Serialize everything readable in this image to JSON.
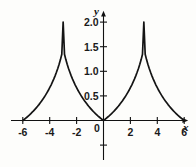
{
  "figure": {
    "background_color": "#fdfdfb",
    "ink_color": "#111111",
    "curve_color": "#141414"
  },
  "axes": {
    "x_axis_name": "x",
    "y_axis_name": "y",
    "origin_label": "0"
  },
  "chart_data": {
    "type": "line",
    "title": "",
    "xlabel": "x",
    "ylabel": "y",
    "xlim": [
      -6.6,
      6.6
    ],
    "ylim": [
      -0.85,
      2.25
    ],
    "grid": false,
    "legend": null,
    "x_ticks": [
      -6,
      -4,
      -2,
      0,
      2,
      4,
      6
    ],
    "x_tick_labels": [
      "-6",
      "-4",
      "-2",
      "0",
      "2",
      "4",
      "6"
    ],
    "y_ticks": [
      0.5,
      1.0,
      1.5,
      2.0
    ],
    "y_tick_labels": [
      "0.5",
      "1.0",
      "1.5",
      "2.0"
    ],
    "annotations": [
      {
        "text": "peak",
        "x": -3,
        "y": 2.0
      },
      {
        "text": "peak",
        "x": 3,
        "y": 2.0
      },
      {
        "text": "zero",
        "x": 0,
        "y": 0
      },
      {
        "text": "zero",
        "x": -6,
        "y": 0
      },
      {
        "text": "zero",
        "x": 6,
        "y": 0
      }
    ],
    "series": [
      {
        "name": "curve",
        "x": [
          -6.0,
          -5.9,
          -5.8,
          -5.7,
          -5.6,
          -5.5,
          -5.4,
          -5.3,
          -5.2,
          -5.1,
          -5.0,
          -4.9,
          -4.8,
          -4.7,
          -4.6,
          -4.5,
          -4.4,
          -4.3,
          -4.2,
          -4.1,
          -4.0,
          -3.9,
          -3.8,
          -3.7,
          -3.6,
          -3.5,
          -3.4,
          -3.3,
          -3.2,
          -3.1,
          -3.0,
          -2.9,
          -2.8,
          -2.7,
          -2.6,
          -2.5,
          -2.4,
          -2.3,
          -2.2,
          -2.1,
          -2.0,
          -1.9,
          -1.8,
          -1.7,
          -1.6,
          -1.5,
          -1.4,
          -1.3,
          -1.2,
          -1.1,
          -1.0,
          -0.9,
          -0.8,
          -0.7,
          -0.6,
          -0.5,
          -0.4,
          -0.3,
          -0.2,
          -0.1,
          0.0,
          0.1,
          0.2,
          0.3,
          0.4,
          0.5,
          0.6,
          0.7,
          0.8,
          0.9,
          1.0,
          1.1,
          1.2,
          1.3,
          1.4,
          1.5,
          1.6,
          1.7,
          1.8,
          1.9,
          2.0,
          2.1,
          2.2,
          2.3,
          2.4,
          2.5,
          2.6,
          2.7,
          2.8,
          2.9,
          3.0,
          3.1,
          3.2,
          3.3,
          3.4,
          3.5,
          3.6,
          3.7,
          3.8,
          3.9,
          4.0,
          4.1,
          4.2,
          4.3,
          4.4,
          4.5,
          4.6,
          4.7,
          4.8,
          4.9,
          5.0,
          5.1,
          5.2,
          5.3,
          5.4,
          5.5,
          5.6,
          5.7,
          5.8,
          5.9,
          6.0
        ],
        "y": [
          0.0,
          0.021,
          0.043,
          0.066,
          0.09,
          0.115,
          0.141,
          0.168,
          0.196,
          0.226,
          0.257,
          0.289,
          0.323,
          0.359,
          0.396,
          0.435,
          0.476,
          0.52,
          0.566,
          0.614,
          0.666,
          0.72,
          0.779,
          0.841,
          0.908,
          0.98,
          1.058,
          1.143,
          1.238,
          1.348,
          2.0,
          1.348,
          1.238,
          1.143,
          1.058,
          0.98,
          0.908,
          0.841,
          0.779,
          0.72,
          0.666,
          0.614,
          0.566,
          0.52,
          0.476,
          0.435,
          0.396,
          0.359,
          0.323,
          0.289,
          0.257,
          0.226,
          0.196,
          0.168,
          0.141,
          0.115,
          0.09,
          0.066,
          0.043,
          0.021,
          0.0,
          0.021,
          0.043,
          0.066,
          0.09,
          0.115,
          0.141,
          0.168,
          0.196,
          0.226,
          0.257,
          0.289,
          0.323,
          0.359,
          0.396,
          0.435,
          0.476,
          0.52,
          0.566,
          0.614,
          0.666,
          0.72,
          0.779,
          0.841,
          0.908,
          0.98,
          1.058,
          1.143,
          1.238,
          1.348,
          2.0,
          1.348,
          1.238,
          1.143,
          1.058,
          0.98,
          0.908,
          0.841,
          0.779,
          0.72,
          0.666,
          0.614,
          0.566,
          0.52,
          0.476,
          0.435,
          0.396,
          0.359,
          0.323,
          0.289,
          0.257,
          0.226,
          0.196,
          0.168,
          0.141,
          0.115,
          0.09,
          0.066,
          0.043,
          0.021,
          0.0
        ]
      }
    ]
  }
}
